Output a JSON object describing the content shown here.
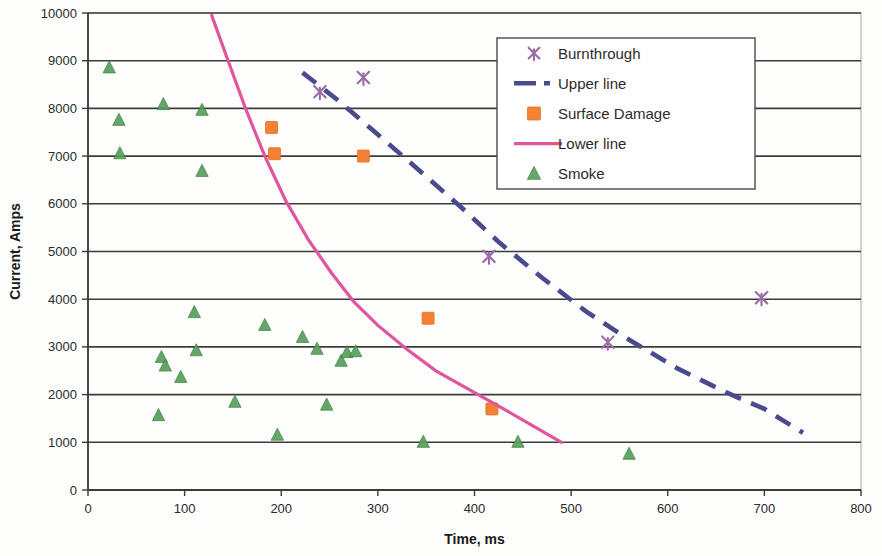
{
  "chart_data": {
    "type": "scatter",
    "title": "",
    "xlabel": "Time, ms",
    "ylabel": "Current, Amps",
    "xlim": [
      0,
      800
    ],
    "ylim": [
      0,
      10000
    ],
    "xticks": [
      0,
      100,
      200,
      300,
      400,
      500,
      600,
      700,
      800
    ],
    "yticks": [
      0,
      1000,
      2000,
      3000,
      4000,
      5000,
      6000,
      7000,
      8000,
      9000,
      10000
    ],
    "xtick_labels": [
      "0",
      "100",
      "200",
      "300",
      "400",
      "500",
      "600",
      "700",
      "800"
    ],
    "ytick_labels": [
      "0",
      "1000",
      "2000",
      "3000",
      "4000",
      "5000",
      "6000",
      "7000",
      "8000",
      "9000",
      "10000"
    ],
    "grid": "horizontal",
    "legend_position": "top-right",
    "series": [
      {
        "name": "Burnthrough",
        "marker": "x-star",
        "color": "#9b6aa8",
        "points": [
          [
            240,
            8350
          ],
          [
            285,
            8650
          ],
          [
            415,
            4900
          ],
          [
            697,
            4030
          ],
          [
            538,
            3100
          ]
        ]
      },
      {
        "name": "Upper line",
        "marker": "dashed-line",
        "color": "#4a4a8f",
        "points": [
          [
            222,
            8750
          ],
          [
            260,
            8150
          ],
          [
            300,
            7450
          ],
          [
            340,
            6750
          ],
          [
            385,
            5950
          ],
          [
            425,
            5200
          ],
          [
            470,
            4450
          ],
          [
            515,
            3750
          ],
          [
            560,
            3150
          ],
          [
            610,
            2550
          ],
          [
            660,
            2050
          ],
          [
            700,
            1700
          ],
          [
            740,
            1200
          ]
        ]
      },
      {
        "name": "Surface Damage",
        "marker": "square",
        "color": "#f58232",
        "points": [
          [
            190,
            7600
          ],
          [
            193,
            7050
          ],
          [
            285,
            7000
          ],
          [
            352,
            3600
          ],
          [
            418,
            1700
          ]
        ]
      },
      {
        "name": "Lower line",
        "marker": "solid-line",
        "color": "#e0559b",
        "points": [
          [
            128,
            9950
          ],
          [
            145,
            9000
          ],
          [
            163,
            8000
          ],
          [
            183,
            7000
          ],
          [
            205,
            6050
          ],
          [
            228,
            5250
          ],
          [
            252,
            4550
          ],
          [
            275,
            3950
          ],
          [
            300,
            3450
          ],
          [
            330,
            2950
          ],
          [
            360,
            2500
          ],
          [
            395,
            2100
          ],
          [
            430,
            1700
          ],
          [
            460,
            1350
          ],
          [
            490,
            1000
          ]
        ]
      },
      {
        "name": "Smoke",
        "marker": "triangle",
        "color": "#57a05a",
        "points": [
          [
            22,
            8850
          ],
          [
            32,
            7750
          ],
          [
            33,
            7050
          ],
          [
            78,
            8080
          ],
          [
            118,
            7960
          ],
          [
            118,
            6680
          ],
          [
            73,
            1560
          ],
          [
            76,
            2780
          ],
          [
            80,
            2600
          ],
          [
            96,
            2360
          ],
          [
            110,
            3720
          ],
          [
            112,
            2920
          ],
          [
            152,
            1840
          ],
          [
            183,
            3450
          ],
          [
            196,
            1150
          ],
          [
            222,
            3200
          ],
          [
            237,
            2950
          ],
          [
            247,
            1780
          ],
          [
            262,
            2700
          ],
          [
            268,
            2880
          ],
          [
            277,
            2900
          ],
          [
            347,
            1000
          ],
          [
            445,
            1000
          ],
          [
            560,
            750
          ]
        ]
      }
    ]
  },
  "legend": {
    "entries": [
      {
        "label": "Burnthrough",
        "marker": "x-star",
        "color": "#9b6aa8"
      },
      {
        "label": "Upper line",
        "marker": "dashed-line",
        "color": "#4a4a8f"
      },
      {
        "label": "Surface Damage",
        "marker": "square",
        "color": "#f58232"
      },
      {
        "label": "Lower line",
        "marker": "solid-line",
        "color": "#e0559b"
      },
      {
        "label": "Smoke",
        "marker": "triangle",
        "color": "#57a05a"
      }
    ]
  },
  "colors": {
    "burnthrough": "#9b6aa8",
    "upper_line": "#4a4a8f",
    "surface_damage": "#f58232",
    "lower_line": "#e0559b",
    "smoke": "#57a05a",
    "grid": "#3c3c3c",
    "axis": "#3b3b3b",
    "background": "#fdfdfc"
  }
}
